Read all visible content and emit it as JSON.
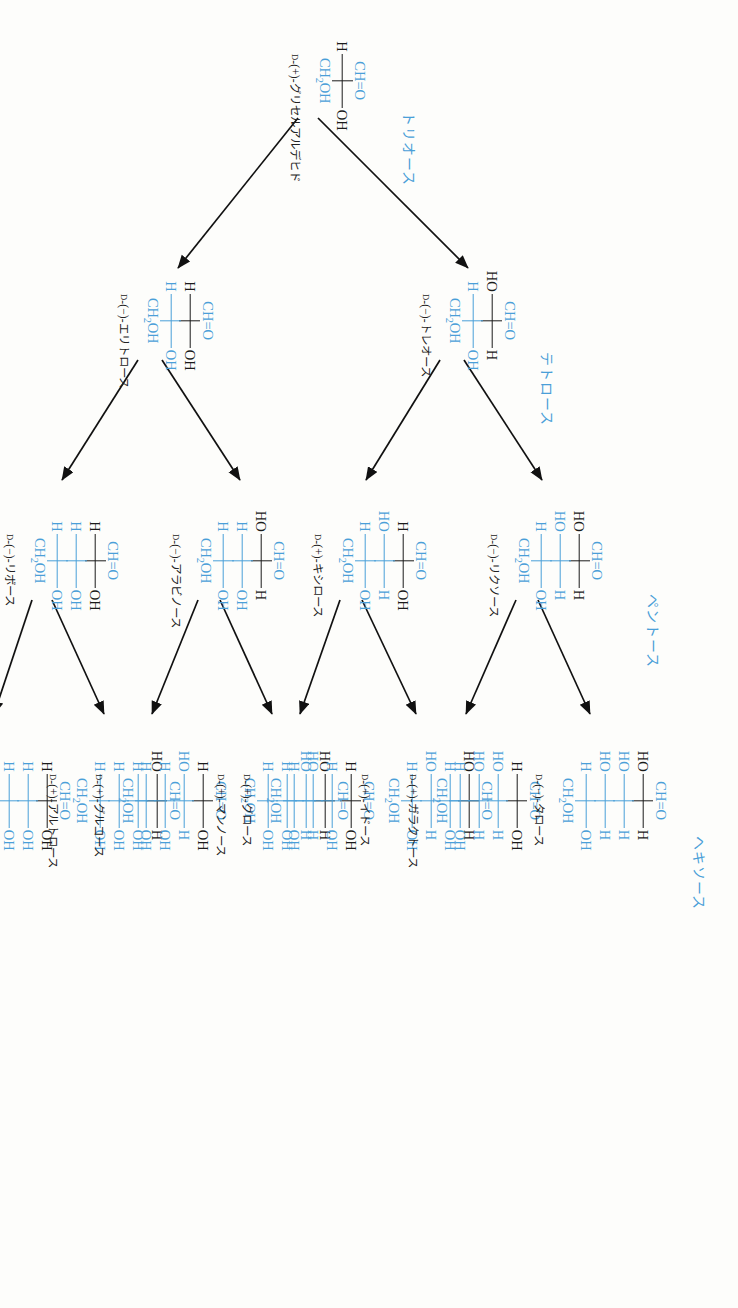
{
  "figure": {
    "colors": {
      "accent": "#4a9fd8",
      "text": "#1a1a1a",
      "background": "#fdfdfb"
    }
  },
  "groups": [
    {
      "id": "triose",
      "label": "トリオース"
    },
    {
      "id": "tetrose",
      "label": "テトロース"
    },
    {
      "id": "pentose",
      "label": "ペントース"
    },
    {
      "id": "hexose",
      "label": "ヘキソース"
    }
  ],
  "common": {
    "cho": "CH=O",
    "ch2oh": "CH",
    "ch2oh_sub": "2",
    "ch2oh_tail": "OH",
    "h": "H",
    "oh": "OH",
    "ho": "HO"
  },
  "molecules": [
    {
      "id": "glyceraldehyde",
      "name_prefix": "D",
      "name": "-(+)-グリセルアルデヒド",
      "top": "CH=O",
      "bottom": "CH2OH",
      "rungs": [
        {
          "left": "H",
          "right": "OH",
          "color": "black"
        }
      ]
    },
    {
      "id": "erythrose",
      "name_prefix": "D",
      "name": "-(−)-エリトロース",
      "top": "CH=O",
      "bottom": "CH2OH",
      "rungs": [
        {
          "left": "H",
          "right": "OH",
          "color": "black"
        },
        {
          "left": "H",
          "right": "OH",
          "color": "blue"
        }
      ]
    },
    {
      "id": "threose",
      "name_prefix": "D",
      "name": "-(−)-トレオース",
      "top": "CH=O",
      "bottom": "CH2OH",
      "rungs": [
        {
          "left": "HO",
          "right": "H",
          "color": "black"
        },
        {
          "left": "H",
          "right": "OH",
          "color": "blue"
        }
      ]
    },
    {
      "id": "ribose",
      "name_prefix": "D",
      "name": "-(−)-リボース",
      "top": "CH=O",
      "bottom": "CH2OH",
      "rungs": [
        {
          "left": "H",
          "right": "OH",
          "color": "black"
        },
        {
          "left": "H",
          "right": "OH",
          "color": "blue"
        },
        {
          "left": "H",
          "right": "OH",
          "color": "blue"
        }
      ]
    },
    {
      "id": "arabinose",
      "name_prefix": "D",
      "name": "-(−)-アラビノース",
      "top": "CH=O",
      "bottom": "CH2OH",
      "rungs": [
        {
          "left": "HO",
          "right": "H",
          "color": "black"
        },
        {
          "left": "H",
          "right": "OH",
          "color": "blue"
        },
        {
          "left": "H",
          "right": "OH",
          "color": "blue"
        }
      ]
    },
    {
      "id": "xylose",
      "name_prefix": "D",
      "name": "-(+)-キシロース",
      "top": "CH=O",
      "bottom": "CH2OH",
      "rungs": [
        {
          "left": "H",
          "right": "OH",
          "color": "black"
        },
        {
          "left": "HO",
          "right": "H",
          "color": "blue"
        },
        {
          "left": "H",
          "right": "OH",
          "color": "blue"
        }
      ]
    },
    {
      "id": "lyxose",
      "name_prefix": "D",
      "name": "-(−)-リクソース",
      "top": "CH=O",
      "bottom": "CH2OH",
      "rungs": [
        {
          "left": "HO",
          "right": "H",
          "color": "black"
        },
        {
          "left": "HO",
          "right": "H",
          "color": "blue"
        },
        {
          "left": "H",
          "right": "OH",
          "color": "blue"
        }
      ]
    },
    {
      "id": "allose",
      "name_prefix": "D",
      "name": "-(+)-アロース",
      "top": "CH=O",
      "bottom": "CH2OH",
      "rungs": [
        {
          "left": "H",
          "right": "OH",
          "color": "black"
        },
        {
          "left": "H",
          "right": "OH",
          "color": "blue"
        },
        {
          "left": "H",
          "right": "OH",
          "color": "blue"
        },
        {
          "left": "H",
          "right": "OH",
          "color": "blue"
        }
      ]
    },
    {
      "id": "altrose",
      "name_prefix": "D",
      "name": "-(+)-アルトロース",
      "top": "CH=O",
      "bottom": "CH2OH",
      "rungs": [
        {
          "left": "HO",
          "right": "H",
          "color": "black"
        },
        {
          "left": "H",
          "right": "OH",
          "color": "blue"
        },
        {
          "left": "H",
          "right": "OH",
          "color": "blue"
        },
        {
          "left": "H",
          "right": "OH",
          "color": "blue"
        }
      ]
    },
    {
      "id": "glucose",
      "name_prefix": "D",
      "name": "-(+)-グルコース",
      "top": "CH=O",
      "bottom": "CH2OH",
      "rungs": [
        {
          "left": "H",
          "right": "OH",
          "color": "black"
        },
        {
          "left": "HO",
          "right": "H",
          "color": "blue"
        },
        {
          "left": "H",
          "right": "OH",
          "color": "blue"
        },
        {
          "left": "H",
          "right": "OH",
          "color": "blue"
        }
      ]
    },
    {
      "id": "mannose",
      "name_prefix": "D",
      "name": "-(+)-マンノース",
      "top": "CH=O",
      "bottom": "CH2OH",
      "rungs": [
        {
          "left": "HO",
          "right": "H",
          "color": "black"
        },
        {
          "left": "HO",
          "right": "H",
          "color": "blue"
        },
        {
          "left": "H",
          "right": "OH",
          "color": "blue"
        },
        {
          "left": "H",
          "right": "OH",
          "color": "blue"
        }
      ]
    },
    {
      "id": "gulose",
      "name_prefix": "D",
      "name": "-(+)-グロース",
      "top": "CH=O",
      "bottom": "CH2OH",
      "rungs": [
        {
          "left": "H",
          "right": "OH",
          "color": "black"
        },
        {
          "left": "H",
          "right": "OH",
          "color": "blue"
        },
        {
          "left": "HO",
          "right": "H",
          "color": "blue"
        },
        {
          "left": "H",
          "right": "OH",
          "color": "blue"
        }
      ]
    },
    {
      "id": "idose",
      "name_prefix": "D",
      "name": "-(+)-イドース",
      "top": "CH=O",
      "bottom": "CH2OH",
      "rungs": [
        {
          "left": "HO",
          "right": "H",
          "color": "black"
        },
        {
          "left": "H",
          "right": "OH",
          "color": "blue"
        },
        {
          "left": "HO",
          "right": "H",
          "color": "blue"
        },
        {
          "left": "H",
          "right": "OH",
          "color": "blue"
        }
      ]
    },
    {
      "id": "galactose",
      "name_prefix": "D",
      "name": "-(+)-ガラクトース",
      "top": "CH=O",
      "bottom": "CH2OH",
      "rungs": [
        {
          "left": "H",
          "right": "OH",
          "color": "black"
        },
        {
          "left": "HO",
          "right": "H",
          "color": "blue"
        },
        {
          "left": "HO",
          "right": "H",
          "color": "blue"
        },
        {
          "left": "H",
          "right": "OH",
          "color": "blue"
        }
      ]
    },
    {
      "id": "talose",
      "name_prefix": "D",
      "name": "-(−)-タロース",
      "top": "CH=O",
      "bottom": "CH2OH",
      "rungs": [
        {
          "left": "HO",
          "right": "H",
          "color": "black"
        },
        {
          "left": "HO",
          "right": "H",
          "color": "blue"
        },
        {
          "left": "HO",
          "right": "H",
          "color": "blue"
        },
        {
          "left": "H",
          "right": "OH",
          "color": "blue"
        }
      ]
    }
  ]
}
